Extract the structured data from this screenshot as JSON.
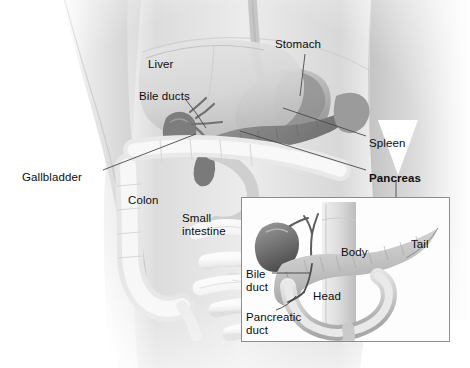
{
  "figure": {
    "style": "grayscale medical illustration of a human torso with an inset detail panel",
    "background_color": "#ffffff",
    "label_color": "#0d0d0d",
    "leader_line_color": "#4a4a4a",
    "inset_border_color": "#8d8d8d"
  },
  "main_labels": [
    {
      "id": "liver",
      "text": "Liver",
      "bold": false,
      "x": 148,
      "y": 58,
      "leader": false
    },
    {
      "id": "bile-ducts",
      "text": "Bile ducts",
      "bold": false,
      "x": 139,
      "y": 90,
      "leader": true
    },
    {
      "id": "stomach",
      "text": "Stomach",
      "bold": false,
      "x": 275,
      "y": 38,
      "leader": true
    },
    {
      "id": "spleen",
      "text": "Spleen",
      "bold": false,
      "x": 369,
      "y": 137,
      "leader": true
    },
    {
      "id": "pancreas",
      "text": "Pancreas",
      "bold": true,
      "x": 369,
      "y": 172,
      "leader": true
    },
    {
      "id": "gallbladder",
      "text": "Gallbladder",
      "bold": false,
      "x": 22,
      "y": 171,
      "leader": true
    },
    {
      "id": "colon",
      "text": "Colon",
      "bold": false,
      "x": 128,
      "y": 194,
      "leader": false
    },
    {
      "id": "small-intestine",
      "text": "Small\nintestine",
      "bold": false,
      "x": 182,
      "y": 212,
      "leader": false
    }
  ],
  "inset_labels": [
    {
      "id": "body",
      "text": "Body",
      "x": 341,
      "y": 246,
      "leader": false
    },
    {
      "id": "tail",
      "text": "Tail",
      "x": 411,
      "y": 238,
      "leader": false
    },
    {
      "id": "head",
      "text": "Head",
      "x": 313,
      "y": 290,
      "leader": false
    },
    {
      "id": "bile-duct",
      "text": "Bile\nduct",
      "x": 246,
      "y": 268,
      "leader": true
    },
    {
      "id": "pancreatic-duct",
      "text": "Pancreatic\nduct",
      "x": 246,
      "y": 311,
      "leader": true
    }
  ],
  "organs": [
    {
      "id": "liver",
      "name": "Liver"
    },
    {
      "id": "stomach",
      "name": "Stomach"
    },
    {
      "id": "spleen",
      "name": "Spleen"
    },
    {
      "id": "pancreas",
      "name": "Pancreas"
    },
    {
      "id": "gallbladder",
      "name": "Gallbladder"
    },
    {
      "id": "bile-ducts",
      "name": "Bile ducts"
    },
    {
      "id": "colon",
      "name": "Colon"
    },
    {
      "id": "small-intestine",
      "name": "Small intestine"
    }
  ]
}
